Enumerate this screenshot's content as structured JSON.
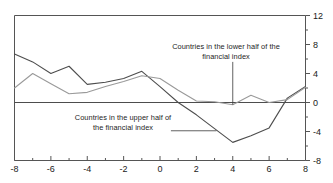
{
  "chart_data": {
    "type": "line",
    "title": "",
    "xlabel": "",
    "ylabel": "",
    "xlim": [
      -8,
      8
    ],
    "ylim": [
      -8,
      12
    ],
    "grid": false,
    "legend_position": "inline-annotations",
    "y_axis_side": "right",
    "x_ticks": [
      -8,
      -6,
      -4,
      -2,
      0,
      2,
      4,
      6,
      8
    ],
    "x_tick_labels": [
      "-8",
      "-6",
      "-4",
      "-2",
      "0",
      "2",
      "4",
      "6",
      "8"
    ],
    "x_minor_ticks": [
      -7,
      -5,
      -3,
      -1,
      1,
      3,
      5,
      7
    ],
    "y_ticks": [
      12,
      8,
      4,
      0,
      -4,
      -8
    ],
    "y_tick_labels": [
      "12",
      "8",
      "4",
      "0",
      "-4",
      "-8"
    ],
    "y_minor_ticks": [
      10,
      6,
      2,
      -2,
      -6
    ],
    "zero_line": 0,
    "x": [
      -8,
      -7,
      -6,
      -5,
      -4,
      -3,
      -2,
      -1,
      0,
      1,
      2,
      3,
      4,
      5,
      6,
      7,
      8
    ],
    "series": [
      {
        "name": "Countries in the upper half of the financial index",
        "color": "#4d4d4d",
        "width": 1.1,
        "values": [
          6.7,
          5.6,
          4.0,
          5.0,
          2.5,
          2.8,
          3.3,
          4.3,
          2.2,
          0.0,
          -1.7,
          -3.6,
          -5.5,
          -4.6,
          -3.5,
          0.6,
          2.2
        ]
      },
      {
        "name": "Countries in the lower half of the financial index",
        "color": "#9a9a9a",
        "width": 1.1,
        "values": [
          2.0,
          4.0,
          2.6,
          1.2,
          1.4,
          2.2,
          2.9,
          3.7,
          3.3,
          1.7,
          0.2,
          0.1,
          -0.3,
          1.0,
          0.0,
          0.4,
          2.1
        ]
      }
    ],
    "annotations": [
      {
        "id": "lower-half-label",
        "line1": "Countries in the lower half of the",
        "line2": "financial index",
        "leader": {
          "from_x": 4.0,
          "from_y": 5.6,
          "to_x": 4.0,
          "to_y": -0.3
        }
      },
      {
        "id": "upper-half-label",
        "line1": "Countries in the upper half of",
        "line2": "the financial index",
        "leader": {
          "from_x": 0.6,
          "from_y": -3.9,
          "to_x": 3.1,
          "to_y": -3.9
        }
      }
    ]
  },
  "axis": {
    "x_tick_labels": [
      "-8",
      "-6",
      "-4",
      "-2",
      "0",
      "2",
      "4",
      "6",
      "8"
    ],
    "y_tick_labels": [
      "12",
      "8",
      "4",
      "0",
      "-4",
      "-8"
    ]
  },
  "annotations": {
    "lower": {
      "line1": "Countries in the lower half of the",
      "line2": "financial index"
    },
    "upper": {
      "line1": "Countries in the upper half of",
      "line2": "the financial index"
    }
  },
  "colors": {
    "upper_series": "#4d4d4d",
    "lower_series": "#9a9a9a",
    "frame": "#555555",
    "text": "#1d1d1d",
    "background": "#ffffff"
  }
}
